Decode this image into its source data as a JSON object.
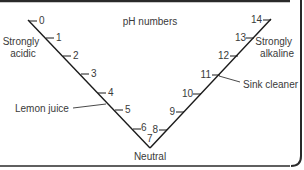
{
  "title": "pH numbers",
  "scale": {
    "min": 0,
    "max": 14,
    "labels": [
      "0",
      "1",
      "2",
      "3",
      "4",
      "5",
      "6",
      "7",
      "8",
      "9",
      "10",
      "11",
      "12",
      "13",
      "14"
    ]
  },
  "annotations": {
    "strongly_acidic_line1": "Strongly",
    "strongly_acidic_line2": "acidic",
    "strongly_alkaline_line1": "Strongly",
    "strongly_alkaline_line2": "alkaline",
    "lemon_juice": "Lemon juice",
    "sink_cleaner": "Sink cleaner",
    "neutral": "Neutral"
  },
  "examples": [
    {
      "label": "Lemon juice",
      "ph": 5
    },
    {
      "label": "Sink cleaner",
      "ph": 11
    }
  ],
  "colors": {
    "line": "#1a1a1a",
    "text": "#3a3a3a",
    "border": "#2a2a2a",
    "background": "#ffffff"
  }
}
